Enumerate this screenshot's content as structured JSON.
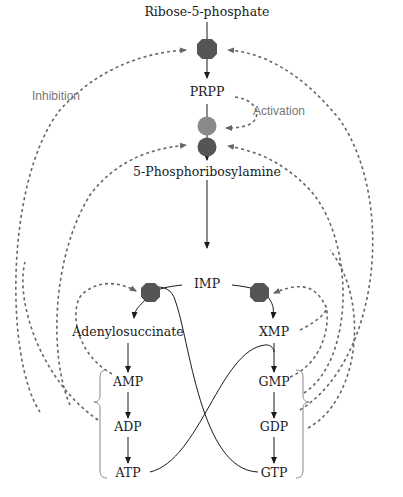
{
  "diagram": {
    "type": "metabolic-pathway",
    "colors": {
      "enzyme_inhibited": "#555555",
      "enzyme_activated": "#8a8a8a",
      "solid_arrow": "#1a1a1a",
      "feedback_dash": "#666666",
      "annotation_text": "#777777"
    },
    "labels": {
      "inhibition": "Inhibition",
      "activation": "Activation"
    },
    "nodes": {
      "ribose5p": "Ribose-5-phosphate",
      "prpp": "PRPP",
      "phosphoribosylamine": "5-Phosphoribosylamine",
      "imp": "IMP",
      "adenylosuccinate": "Adenylosuccinate",
      "xmp": "XMP",
      "amp": "AMP",
      "adp": "ADP",
      "atp": "ATP",
      "gmp": "GMP",
      "gdp": "GDP",
      "gtp": "GTP"
    },
    "enzymes": [
      {
        "id": "prpp-synthetase",
        "shape": "octagon",
        "regulation": "inhibited"
      },
      {
        "id": "amidotransferase-activation-site",
        "shape": "circle",
        "regulation": "activated"
      },
      {
        "id": "amidotransferase",
        "shape": "circle",
        "regulation": "inhibited"
      },
      {
        "id": "adenylosuccinate-synthetase",
        "shape": "octagon",
        "regulation": "inhibited"
      },
      {
        "id": "imp-dehydrogenase",
        "shape": "octagon",
        "regulation": "inhibited"
      }
    ],
    "edges": [
      {
        "from": "Ribose-5-phosphate",
        "to": "PRPP",
        "style": "solid"
      },
      {
        "from": "PRPP",
        "to": "5-Phosphoribosylamine",
        "style": "solid"
      },
      {
        "from": "5-Phosphoribosylamine",
        "to": "IMP",
        "style": "solid"
      },
      {
        "from": "IMP",
        "to": "Adenylosuccinate",
        "style": "solid",
        "requires": "GTP"
      },
      {
        "from": "IMP",
        "to": "XMP",
        "style": "solid"
      },
      {
        "from": "Adenylosuccinate",
        "to": "AMP",
        "style": "solid"
      },
      {
        "from": "XMP",
        "to": "GMP",
        "style": "solid",
        "requires": "ATP"
      },
      {
        "from": "AMP",
        "to": "ADP",
        "style": "solid"
      },
      {
        "from": "ADP",
        "to": "ATP",
        "style": "solid"
      },
      {
        "from": "GMP",
        "to": "GDP",
        "style": "solid"
      },
      {
        "from": "GDP",
        "to": "GTP",
        "style": "solid"
      },
      {
        "from": "PRPP",
        "to": "amidotransferase",
        "style": "dashed",
        "type": "activation"
      },
      {
        "from": "AMP/ADP",
        "to": "prpp-synthetase",
        "style": "dashed",
        "type": "inhibition"
      },
      {
        "from": "GMP/GDP",
        "to": "prpp-synthetase",
        "style": "dashed",
        "type": "inhibition"
      },
      {
        "from": "AMP/ADP",
        "to": "amidotransferase",
        "style": "dashed",
        "type": "inhibition"
      },
      {
        "from": "GMP/GDP",
        "to": "amidotransferase",
        "style": "dashed",
        "type": "inhibition"
      },
      {
        "from": "AMP",
        "to": "adenylosuccinate-synthetase",
        "style": "dashed",
        "type": "inhibition"
      },
      {
        "from": "GMP",
        "to": "imp-dehydrogenase",
        "style": "dashed",
        "type": "inhibition"
      }
    ]
  }
}
